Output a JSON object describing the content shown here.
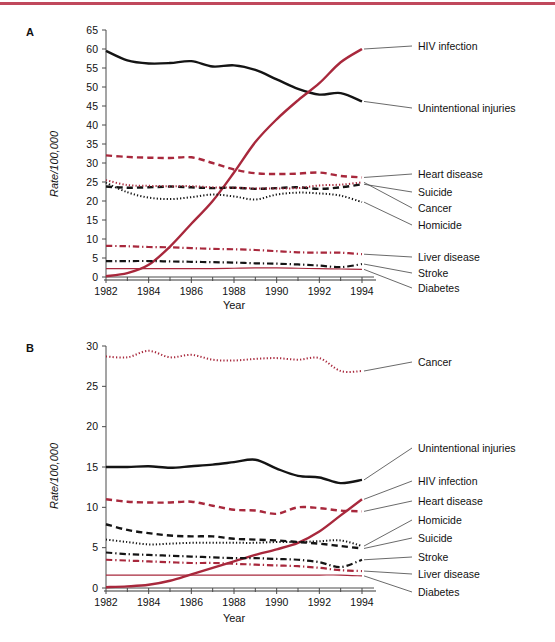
{
  "figure": {
    "top_rule_color": "#c0485c",
    "colors": {
      "red": "#a8283c",
      "black": "#141414",
      "axis": "#4a4a4a",
      "baseline": "#9a9a9a"
    }
  },
  "panelA": {
    "letter": "A",
    "ylabel": "Rate/100,000",
    "xlabel": "Year",
    "yticks": [
      "0",
      "5",
      "10",
      "15",
      "20",
      "25",
      "30",
      "35",
      "40",
      "45",
      "50",
      "55",
      "60",
      "65"
    ],
    "xticks": [
      "1982",
      "1984",
      "1986",
      "1988",
      "1990",
      "1992",
      "1994"
    ],
    "legend": [
      "HIV infection",
      "Unintentional injuries",
      "Heart disease",
      "Suicide",
      "Cancer",
      "Homicide",
      "Liver disease",
      "Stroke",
      "Diabetes"
    ]
  },
  "panelB": {
    "letter": "B",
    "ylabel": "Rate/100,000",
    "xlabel": "Year",
    "yticks": [
      "0",
      "5",
      "10",
      "15",
      "20",
      "25",
      "30"
    ],
    "xticks": [
      "1982",
      "1984",
      "1986",
      "1988",
      "1990",
      "1992",
      "1994"
    ],
    "legend": [
      "Cancer",
      "Unintentional injuries",
      "HIV infection",
      "Heart disease",
      "Homicide",
      "Suicide",
      "Stroke",
      "Liver disease",
      "Diabetes"
    ]
  },
  "chart_data": [
    {
      "type": "line",
      "panel": "A",
      "title": "",
      "xlabel": "Year",
      "ylabel": "Rate/100,000",
      "xlim": [
        1982,
        1994
      ],
      "ylim": [
        0,
        65
      ],
      "grid": false,
      "legend_position": "right-labels-with-leader-lines",
      "x": [
        1982,
        1983,
        1984,
        1985,
        1986,
        1987,
        1988,
        1989,
        1990,
        1991,
        1992,
        1993,
        1994
      ],
      "series": [
        {
          "name": "Unintentional injuries",
          "color": "#141414",
          "style": "solid",
          "width": 2.4,
          "values": [
            59.5,
            57.0,
            56.2,
            56.3,
            56.8,
            55.4,
            55.7,
            54.5,
            52.0,
            49.5,
            48.0,
            48.4,
            46.2
          ]
        },
        {
          "name": "HIV infection",
          "color": "#a8283c",
          "style": "solid",
          "width": 2.4,
          "values": [
            0.2,
            1.0,
            3.2,
            8.0,
            14.0,
            20.0,
            27.5,
            35.5,
            41.5,
            46.5,
            51.0,
            56.5,
            60.0
          ]
        },
        {
          "name": "Heart disease",
          "color": "#a8283c",
          "style": "dashed",
          "width": 2.4,
          "values": [
            32.0,
            31.6,
            31.4,
            31.3,
            31.5,
            30.0,
            28.3,
            27.3,
            27.1,
            27.2,
            27.5,
            26.6,
            26.2
          ]
        },
        {
          "name": "Suicide",
          "color": "#141414",
          "style": "dashed",
          "width": 2.4,
          "values": [
            23.8,
            23.5,
            23.6,
            23.8,
            23.6,
            23.4,
            23.5,
            23.2,
            23.4,
            23.6,
            23.2,
            23.6,
            24.4
          ]
        },
        {
          "name": "Cancer",
          "color": "#a8283c",
          "style": "dotted",
          "width": 2.0,
          "values": [
            25.5,
            24.2,
            24.0,
            23.9,
            23.9,
            23.6,
            23.5,
            23.3,
            23.3,
            23.4,
            24.1,
            24.3,
            24.9
          ]
        },
        {
          "name": "Homicide",
          "color": "#141414",
          "style": "dotted",
          "width": 2.0,
          "values": [
            24.8,
            22.3,
            20.9,
            20.5,
            21.0,
            21.7,
            21.2,
            20.4,
            21.7,
            22.2,
            22.0,
            21.4,
            19.7
          ]
        },
        {
          "name": "Liver disease",
          "color": "#a8283c",
          "style": "dashdot",
          "width": 2.2,
          "values": [
            8.2,
            8.1,
            7.9,
            7.8,
            7.6,
            7.4,
            7.3,
            7.1,
            6.8,
            6.5,
            6.4,
            6.4,
            6.0
          ]
        },
        {
          "name": "Stroke",
          "color": "#141414",
          "style": "dashdot",
          "width": 2.2,
          "values": [
            4.2,
            4.2,
            4.2,
            4.1,
            4.0,
            3.9,
            3.8,
            3.6,
            3.5,
            3.3,
            3.0,
            2.6,
            3.4
          ]
        },
        {
          "name": "Diabetes",
          "color": "#a8283c",
          "style": "solid",
          "width": 1.1,
          "values": [
            2.2,
            2.2,
            2.2,
            2.2,
            2.2,
            2.2,
            2.3,
            2.4,
            2.4,
            2.3,
            2.2,
            2.1,
            2.0
          ]
        }
      ]
    },
    {
      "type": "line",
      "panel": "B",
      "title": "",
      "xlabel": "Year",
      "ylabel": "Rate/100,000",
      "xlim": [
        1982,
        1994
      ],
      "ylim": [
        0,
        30
      ],
      "grid": false,
      "legend_position": "right-labels-with-leader-lines",
      "x": [
        1982,
        1983,
        1984,
        1985,
        1986,
        1987,
        1988,
        1989,
        1990,
        1991,
        1992,
        1993,
        1994
      ],
      "series": [
        {
          "name": "Cancer",
          "color": "#a8283c",
          "style": "dotted",
          "width": 2.0,
          "values": [
            28.7,
            28.6,
            29.4,
            28.6,
            28.9,
            28.3,
            28.2,
            28.4,
            28.5,
            28.3,
            28.5,
            26.9,
            26.9
          ]
        },
        {
          "name": "Unintentional injuries",
          "color": "#141414",
          "style": "solid",
          "width": 2.4,
          "values": [
            15.0,
            15.0,
            15.1,
            14.9,
            15.1,
            15.3,
            15.6,
            15.9,
            14.8,
            13.9,
            13.7,
            13.0,
            13.4
          ]
        },
        {
          "name": "Heart disease",
          "color": "#a8283c",
          "style": "dashed",
          "width": 2.4,
          "values": [
            11.0,
            10.7,
            10.6,
            10.6,
            10.7,
            10.2,
            9.7,
            9.6,
            9.2,
            10.0,
            9.9,
            9.6,
            9.5
          ]
        },
        {
          "name": "HIV infection",
          "color": "#a8283c",
          "style": "solid",
          "width": 2.4,
          "values": [
            0.1,
            0.2,
            0.4,
            0.9,
            1.7,
            2.5,
            3.3,
            4.1,
            4.8,
            5.6,
            7.0,
            9.0,
            11.0
          ]
        },
        {
          "name": "Suicide",
          "color": "#141414",
          "style": "dashed",
          "width": 2.4,
          "values": [
            7.9,
            7.2,
            6.8,
            6.5,
            6.4,
            6.4,
            6.1,
            6.0,
            5.9,
            5.7,
            5.5,
            5.2,
            4.9
          ]
        },
        {
          "name": "Homicide",
          "color": "#141414",
          "style": "dotted",
          "width": 2.0,
          "values": [
            6.0,
            5.7,
            5.4,
            5.5,
            5.6,
            5.6,
            5.6,
            5.6,
            5.7,
            5.7,
            5.8,
            5.9,
            5.2
          ]
        },
        {
          "name": "Stroke",
          "color": "#141414",
          "style": "dashdot",
          "width": 2.2,
          "values": [
            4.4,
            4.2,
            4.1,
            4.0,
            3.9,
            3.8,
            3.7,
            3.7,
            3.6,
            3.5,
            3.2,
            2.6,
            3.5
          ]
        },
        {
          "name": "Liver disease",
          "color": "#a8283c",
          "style": "dashdot",
          "width": 2.2,
          "values": [
            3.5,
            3.4,
            3.3,
            3.2,
            3.1,
            3.1,
            3.0,
            2.9,
            2.8,
            2.7,
            2.5,
            2.2,
            2.1
          ]
        },
        {
          "name": "Diabetes",
          "color": "#a8283c",
          "style": "solid",
          "width": 1.1,
          "values": [
            1.6,
            1.6,
            1.6,
            1.6,
            1.6,
            1.6,
            1.6,
            1.6,
            1.6,
            1.6,
            1.6,
            1.6,
            1.5
          ]
        }
      ]
    }
  ]
}
